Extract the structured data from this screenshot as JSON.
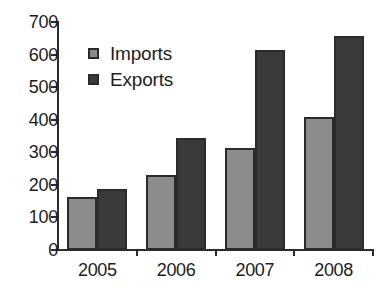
{
  "chart_data": {
    "type": "bar",
    "title": "",
    "subtitle": "",
    "xlabel": "",
    "ylabel": "",
    "categories": [
      "2005",
      "2006",
      "2007",
      "2008"
    ],
    "series": [
      {
        "name": "Imports",
        "color": "#8c8c8c",
        "values": [
          162,
          230,
          313,
          408
        ]
      },
      {
        "name": "Exports",
        "color": "#3a3a3a",
        "values": [
          186,
          345,
          615,
          658
        ]
      }
    ],
    "ylim": [
      0,
      700
    ],
    "ytick_step": 100,
    "yticks": [
      "0",
      "100",
      "200",
      "300",
      "400",
      "500",
      "600",
      "700"
    ],
    "grid": false,
    "legend_position": "top-left",
    "axis_color": "#2b2b2b",
    "background": "#ffffff"
  },
  "legend": {
    "items": [
      {
        "label": "Imports",
        "swatch": "imports-swatch-icon"
      },
      {
        "label": "Exports",
        "swatch": "exports-swatch-icon"
      }
    ]
  }
}
